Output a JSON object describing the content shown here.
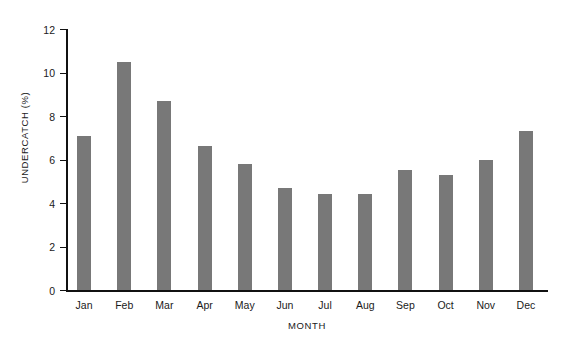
{
  "chart_data": {
    "type": "bar",
    "title": "",
    "xlabel": "MONTH",
    "ylabel": "UNDERCATCH (%)",
    "categories": [
      "Jan",
      "Feb",
      "Mar",
      "Apr",
      "May",
      "Jun",
      "Jul",
      "Aug",
      "Sep",
      "Oct",
      "Nov",
      "Dec"
    ],
    "values": [
      7.1,
      10.5,
      8.7,
      6.6,
      5.8,
      4.7,
      4.4,
      4.4,
      5.5,
      5.3,
      6.0,
      7.3
    ],
    "ylim": [
      0,
      12
    ],
    "yticks": [
      0,
      2,
      4,
      6,
      8,
      10,
      12
    ],
    "ytick_labels": [
      "0",
      "2",
      "4",
      "6",
      "8",
      "10",
      "12"
    ],
    "grid": false,
    "legend": null,
    "bar_color": "#787878",
    "axis_color": "#111111",
    "background_color": "#ffffff"
  }
}
